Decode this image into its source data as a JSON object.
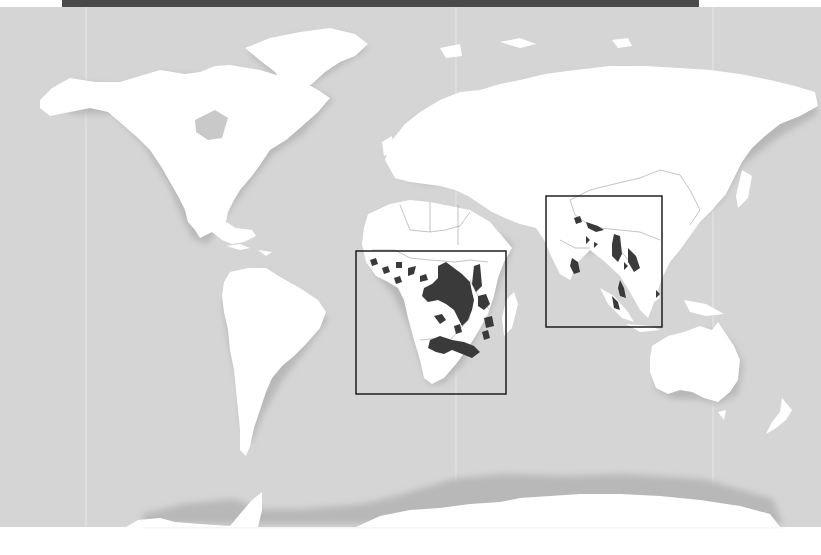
{
  "map": {
    "type": "world-distribution-map",
    "projection": "world",
    "colors": {
      "ocean": "#d5d5d5",
      "land": "#ffffff",
      "range": "#3a3a3a",
      "top_bar": "#4a4a4a",
      "bottom_margin": "#ffffff",
      "frame": "#111111"
    },
    "highlight_frames": [
      {
        "name": "africa-inset-frame",
        "region": "Sub-Saharan Africa",
        "x": 356,
        "y": 251,
        "width": 150,
        "height": 143
      },
      {
        "name": "south-southeast-asia-inset-frame",
        "region": "South and Southeast Asia",
        "x": 546,
        "y": 196,
        "width": 116,
        "height": 131
      }
    ],
    "shaded_regions": [
      "Central Africa",
      "East Africa",
      "Southern Africa",
      "West Africa",
      "India",
      "Sri Lanka",
      "Myanmar",
      "Thailand",
      "Indochina",
      "Sumatra",
      "Borneo"
    ]
  }
}
